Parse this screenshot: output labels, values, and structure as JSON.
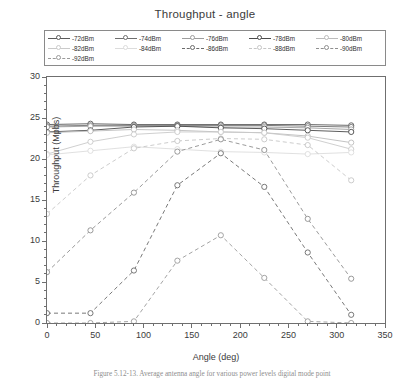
{
  "figure": {
    "title": "Throughput - angle",
    "caption": "Figure 5.12-13.  Average  antenna  angle  for  various  power  levels  digital  mode  point"
  },
  "legend": {
    "entries": [
      {
        "label": "-72dBm",
        "color": "#5a5a5a",
        "dash": "solid"
      },
      {
        "label": "-74dBm",
        "color": "#6e6e6e",
        "dash": "solid"
      },
      {
        "label": "-76dBm",
        "color": "#9d9d9d",
        "dash": "solid"
      },
      {
        "label": "-78dBm",
        "color": "#4a4a4a",
        "dash": "solid"
      },
      {
        "label": "-80dBm",
        "color": "#bcbcbc",
        "dash": "solid"
      },
      {
        "label": "-82dBm",
        "color": "#cacaca",
        "dash": "solid"
      },
      {
        "label": "-84dBm",
        "color": "#dcdcdc",
        "dash": "solid"
      },
      {
        "label": "-86dBm",
        "color": "#6a6a6a",
        "dash": "dashed"
      },
      {
        "label": "-88dBm",
        "color": "#c6c6c6",
        "dash": "dashed"
      },
      {
        "label": "-90dBm",
        "color": "#8f8f8f",
        "dash": "dashed"
      },
      {
        "label": "-92dBm",
        "color": "#9a9a9a",
        "dash": "dashed"
      }
    ]
  },
  "axes": {
    "x": {
      "label": "Angle (deg)",
      "min": 0,
      "max": 350,
      "ticks": [
        0,
        50,
        100,
        150,
        200,
        250,
        300,
        350
      ],
      "minor_step": 10
    },
    "y": {
      "label": "Throughput (Mpbs)",
      "min": 0,
      "max": 30,
      "ticks": [
        0,
        5,
        10,
        15,
        20,
        25,
        30
      ],
      "minor_step": 1
    }
  },
  "chart_data": {
    "type": "line",
    "title": "Throughput - angle",
    "xlabel": "Angle (deg)",
    "ylabel": "Throughput (Mpbs)",
    "xlim": [
      0,
      350
    ],
    "ylim": [
      0,
      30
    ],
    "grid": false,
    "legend_position": "above-plot",
    "x": [
      0,
      45,
      90,
      135,
      180,
      225,
      270,
      315
    ],
    "series": [
      {
        "name": "-72dBm",
        "color": "#5a5a5a",
        "dash": "solid",
        "values": [
          24.2,
          24.3,
          24.2,
          24.2,
          24.2,
          24.2,
          24.2,
          24.1
        ]
      },
      {
        "name": "-74dBm",
        "color": "#6e6e6e",
        "dash": "solid",
        "values": [
          24.0,
          24.1,
          24.1,
          24.1,
          24.1,
          24.1,
          24.0,
          23.9
        ]
      },
      {
        "name": "-76dBm",
        "color": "#9d9d9d",
        "dash": "solid",
        "values": [
          23.9,
          24.0,
          24.0,
          24.0,
          23.9,
          23.9,
          23.8,
          23.6
        ]
      },
      {
        "name": "-78dBm",
        "color": "#4a4a4a",
        "dash": "solid",
        "values": [
          23.3,
          23.5,
          23.9,
          24.0,
          23.8,
          23.7,
          23.5,
          23.3
        ]
      },
      {
        "name": "-80dBm",
        "color": "#bcbcbc",
        "dash": "solid",
        "values": [
          23.2,
          23.4,
          23.6,
          23.5,
          23.3,
          23.2,
          22.8,
          22.0
        ]
      },
      {
        "name": "-82dBm",
        "color": "#cacaca",
        "dash": "solid",
        "values": [
          20.6,
          22.1,
          23.0,
          23.3,
          23.3,
          23.2,
          22.6,
          21.2
        ]
      },
      {
        "name": "-84dBm",
        "color": "#dcdcdc",
        "dash": "solid",
        "values": [
          20.5,
          21.0,
          21.5,
          21.2,
          20.9,
          20.8,
          20.6,
          20.8
        ]
      },
      {
        "name": "-86dBm",
        "color": "#6a6a6a",
        "dash": "dashed",
        "values": [
          1.2,
          1.2,
          6.4,
          16.8,
          20.7,
          16.6,
          8.6,
          1.0
        ]
      },
      {
        "name": "-88dBm",
        "color": "#c6c6c6",
        "dash": "dashed",
        "values": [
          13.3,
          18.0,
          21.3,
          22.2,
          22.5,
          22.4,
          21.7,
          17.4
        ]
      },
      {
        "name": "-90dBm",
        "color": "#8f8f8f",
        "dash": "dashed",
        "values": [
          6.2,
          11.3,
          15.9,
          20.9,
          22.4,
          21.1,
          12.7,
          5.4
        ]
      },
      {
        "name": "-92dBm",
        "color": "#9a9a9a",
        "dash": "dashed",
        "values": [
          0.0,
          0.0,
          0.2,
          7.6,
          10.7,
          5.5,
          0.2,
          0.0
        ]
      }
    ]
  }
}
